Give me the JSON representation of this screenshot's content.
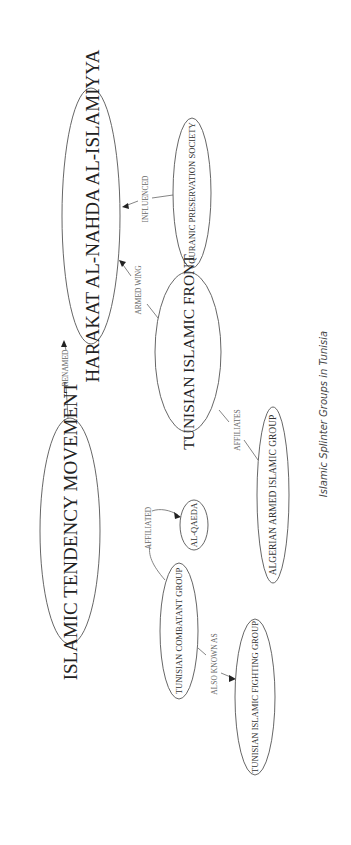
{
  "diagram": {
    "caption": "Islamic Splinter Groups in Tunisia",
    "nodes": {
      "harakat": "HARAKAT AL-NAHDA AL-ISLAMIYYA",
      "quranic": "QURANIC PRESERVATION SOCIETY",
      "itm": "ISLAMIC TENDENCY MOVEMENT",
      "tif": "TUNISIAN ISLAMIC FRONT",
      "alqaeda": "AL-QAEDA",
      "tcg": "TUNISIAN COMBATANT GROUP",
      "aaig": "ALGERIAN ARMED ISLAMIC GROUP",
      "tifg": "TUNISIAN ISLAMIC FIGHTING GROUP"
    },
    "edges": {
      "renamed": "RENAMED",
      "influenced": "INFLUENCED",
      "armed_wing": "ARMED WING",
      "affiliates": "AFFILIATES",
      "affiliated": "AFFILIATED",
      "also_known_as": "ALSO KNOWN AS"
    },
    "colors": {
      "stroke": "#555555",
      "text": "#222222",
      "edge_label": "#666666"
    }
  }
}
